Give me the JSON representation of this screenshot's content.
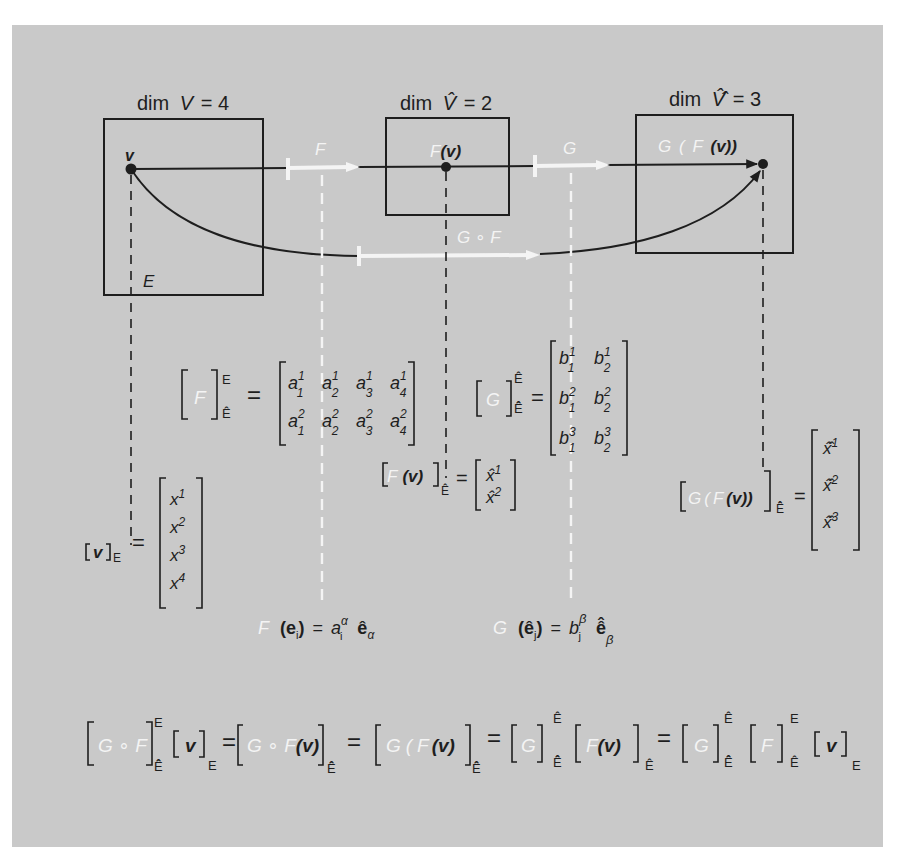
{
  "colors": {
    "background": "#c9c9c9",
    "ink": "#1e1e1e",
    "highlight": "#f4f4f4"
  },
  "spaces": {
    "V": {
      "label": "dim V = 4",
      "dim_prefix": "dim",
      "symbol": "V",
      "eq": "=",
      "dim": "4",
      "basis": "E",
      "point": "v"
    },
    "V_hat": {
      "label": "dim V̂ = 2",
      "dim_prefix": "dim",
      "symbol": "V̂",
      "eq": "=",
      "dim": "2",
      "point_map": "F",
      "point_arg": "(v)"
    },
    "V_hathat": {
      "label": "dim V̂̂ = 3",
      "dim_prefix": "dim",
      "symbol": "V̂̂",
      "eq": "=",
      "dim": "3",
      "point_outer": "G",
      "point_open": "(",
      "point_inner": "F",
      "point_arg": "(v))"
    }
  },
  "maps": {
    "F": "F",
    "G": "G",
    "composite": "G ∘ F"
  },
  "matrix_F": {
    "lhs_map": "F",
    "sup": "E",
    "sub": "Ê",
    "eq": "=",
    "rows": [
      [
        {
          "base": "a",
          "sup": "1",
          "sub": "1"
        },
        {
          "base": "a",
          "sup": "1",
          "sub": "2"
        },
        {
          "base": "a",
          "sup": "1",
          "sub": "3"
        },
        {
          "base": "a",
          "sup": "1",
          "sub": "4"
        }
      ],
      [
        {
          "base": "a",
          "sup": "2",
          "sub": "1"
        },
        {
          "base": "a",
          "sup": "2",
          "sub": "2"
        },
        {
          "base": "a",
          "sup": "2",
          "sub": "3"
        },
        {
          "base": "a",
          "sup": "2",
          "sub": "4"
        }
      ]
    ]
  },
  "matrix_G": {
    "lhs_map": "G",
    "sup": "Ê",
    "sub": "Ê̂",
    "eq": "=",
    "rows": [
      [
        {
          "base": "b",
          "sup": "1",
          "sub": "1"
        },
        {
          "base": "b",
          "sup": "1",
          "sub": "2"
        }
      ],
      [
        {
          "base": "b",
          "sup": "2",
          "sub": "1"
        },
        {
          "base": "b",
          "sup": "2",
          "sub": "2"
        }
      ],
      [
        {
          "base": "b",
          "sup": "3",
          "sub": "1"
        },
        {
          "base": "b",
          "sup": "3",
          "sub": "2"
        }
      ]
    ]
  },
  "vector_v": {
    "lhs": "v",
    "sub": "E",
    "eq": "=",
    "entries": [
      {
        "base": "x",
        "sup": "1"
      },
      {
        "base": "x",
        "sup": "2"
      },
      {
        "base": "x",
        "sup": "3"
      },
      {
        "base": "x",
        "sup": "4"
      }
    ]
  },
  "vector_Fv": {
    "lhs_map": "F",
    "lhs_arg": "(v)",
    "sub": "Ê",
    "eq": "=",
    "entries": [
      {
        "base": "x̂",
        "sup": "1"
      },
      {
        "base": "x̂",
        "sup": "2"
      }
    ]
  },
  "vector_GFv": {
    "lhs_outer": "G",
    "lhs_open": "(",
    "lhs_inner": "F",
    "lhs_arg": "(v))",
    "sub": "Ê̂",
    "eq": "=",
    "entries": [
      {
        "base": "x̂̂",
        "sup": "1"
      },
      {
        "base": "x̂̂",
        "sup": "2"
      },
      {
        "base": "x̂̂",
        "sup": "3"
      }
    ]
  },
  "basis_relations": {
    "F_rel": {
      "map": "F",
      "arg": "(e",
      "arg_sub": "i",
      "close": ")",
      "eq": "=",
      "coef": "a",
      "coef_sup": "α",
      "coef_sub": "i",
      "basis": "ê",
      "basis_sub": "α"
    },
    "G_rel": {
      "map": "G",
      "arg": "(ê",
      "arg_sub": "j",
      "close": ")",
      "eq": "=",
      "coef": "b",
      "coef_sup": "β",
      "coef_sub": "j",
      "basis": "ê̂",
      "basis_sub": "β"
    }
  },
  "composition_equation": {
    "term1": {
      "map": "G ∘ F",
      "sup": "E",
      "sub": "Ê̂"
    },
    "term1_vec": {
      "arg": "v",
      "sub": "E"
    },
    "eq": "=",
    "term2": {
      "map": "G ∘ F",
      "arg": "(v)",
      "sub": "Ê̂"
    },
    "term3": {
      "outer": "G",
      "open": "(",
      "inner": "F",
      "arg": "(v)",
      "sub": "Ê̂"
    },
    "term4": {
      "map": "G",
      "sup": "Ê",
      "sub": "Ê̂"
    },
    "term4_vec": {
      "map": "F",
      "arg": "(v)",
      "sub": "Ê"
    },
    "term5": {
      "map": "G",
      "sup": "Ê",
      "sub": "Ê̂"
    },
    "term5_F": {
      "map": "F",
      "sup": "E",
      "sub": "Ê"
    },
    "term5_vec": {
      "arg": "v",
      "sub": "E"
    }
  }
}
